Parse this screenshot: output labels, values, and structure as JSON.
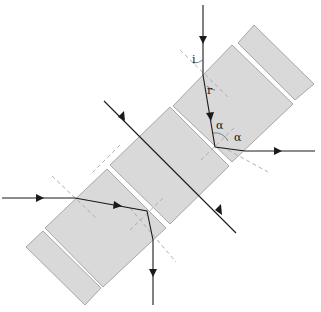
{
  "diagram": {
    "colors": {
      "slab_fill": "#d9d9d9",
      "slab_edge": "#8a8a8a",
      "ray": "#1a1a1a",
      "normal": "#a8a8a8"
    },
    "labels": {
      "incidence_angle": "i",
      "refraction_angle": "r",
      "alpha_1": "α",
      "alpha_2": "α"
    },
    "slabs": [
      {
        "name": "slab-top-thin"
      },
      {
        "name": "slab-upper"
      },
      {
        "name": "slab-middle"
      },
      {
        "name": "slab-lower"
      },
      {
        "name": "slab-bottom-thin"
      }
    ],
    "rays": [
      {
        "name": "ray-top-vertical",
        "note": "vertical ray refracted then reflected out to the right"
      },
      {
        "name": "ray-diagonal-through",
        "note": "ray passing perpendicularly through middle slab"
      },
      {
        "name": "ray-left-horizontal",
        "note": "horizontal ray refracted then exits downward"
      }
    ]
  }
}
